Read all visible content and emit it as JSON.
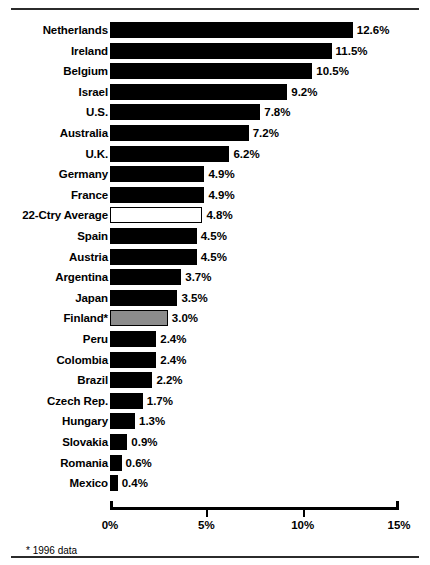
{
  "chart_data": {
    "type": "bar",
    "orientation": "horizontal",
    "title": "",
    "xlabel": "",
    "ylabel": "",
    "xlim": [
      0,
      15
    ],
    "xticks": [
      0,
      5,
      10,
      15
    ],
    "xtick_labels": [
      "0%",
      "5%",
      "10%",
      "15%"
    ],
    "grid": false,
    "legend": null,
    "value_suffix": "%",
    "footnote": "* 1996 data",
    "categories": [
      "Netherlands",
      "Ireland",
      "Belgium",
      "Israel",
      "U.S.",
      "Australia",
      "U.K.",
      "Germany",
      "France",
      "22-Ctry Average",
      "Spain",
      "Austria",
      "Argentina",
      "Japan",
      "Finland*",
      "Peru",
      "Colombia",
      "Brazil",
      "Czech Rep.",
      "Hungary",
      "Slovakia",
      "Romania",
      "Mexico"
    ],
    "values": [
      12.6,
      11.5,
      10.5,
      9.2,
      7.8,
      7.2,
      6.2,
      4.9,
      4.9,
      4.8,
      4.5,
      4.5,
      3.7,
      3.5,
      3.0,
      2.4,
      2.4,
      2.2,
      1.7,
      1.3,
      0.9,
      0.6,
      0.4
    ],
    "value_labels": [
      "12.6%",
      "11.5%",
      "10.5%",
      "9.2%",
      "7.8%",
      "7.2%",
      "6.2%",
      "4.9%",
      "4.9%",
      "4.8%",
      "4.5%",
      "4.5%",
      "3.7%",
      "3.5%",
      "3.0%",
      "2.4%",
      "2.4%",
      "2.2%",
      "1.7%",
      "1.3%",
      "0.9%",
      "0.6%",
      "0.4%"
    ],
    "bar_styles": [
      "solid",
      "solid",
      "solid",
      "solid",
      "solid",
      "solid",
      "solid",
      "solid",
      "solid",
      "open",
      "solid",
      "solid",
      "solid",
      "solid",
      "shaded",
      "solid",
      "solid",
      "solid",
      "solid",
      "solid",
      "solid",
      "solid",
      "solid"
    ],
    "colors": {
      "solid": "#000000",
      "open": "#ffffff",
      "shaded": "#8c8c8c",
      "outline": "#000000",
      "axis": "#000000",
      "text": "#000000",
      "background": "#ffffff"
    }
  }
}
